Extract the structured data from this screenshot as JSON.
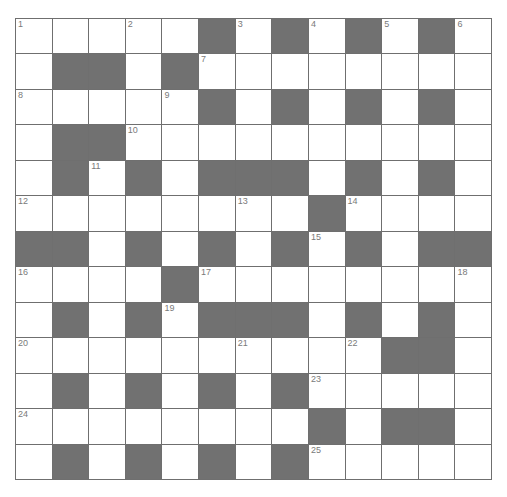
{
  "puzzle": {
    "rows": 13,
    "cols": 13,
    "layout": [
      "WWWWWBWBWBWBW",
      "WBBWBWWWWWWWW",
      "WWWWWBWBWBWBW",
      "WBBWWWWWWWWWW",
      "WBWBWBBBWBWBW",
      "WWWWWWWWBWWWW",
      "BBWBWBWBWBWBB",
      "WWWWBWWWWWWWW",
      "WBWBWBBBWBWBW",
      "WWWWWWWWWWBBW",
      "WBWBWBWBWWWWW",
      "WWWWWWWWBWBBW",
      "WBWBWBWBWWWWW"
    ],
    "numbers": [
      {
        "r": 0,
        "c": 0,
        "n": "1"
      },
      {
        "r": 0,
        "c": 3,
        "n": "2"
      },
      {
        "r": 0,
        "c": 6,
        "n": "3"
      },
      {
        "r": 0,
        "c": 8,
        "n": "4"
      },
      {
        "r": 0,
        "c": 10,
        "n": "5"
      },
      {
        "r": 0,
        "c": 12,
        "n": "6"
      },
      {
        "r": 1,
        "c": 5,
        "n": "7"
      },
      {
        "r": 2,
        "c": 0,
        "n": "8"
      },
      {
        "r": 2,
        "c": 4,
        "n": "9"
      },
      {
        "r": 3,
        "c": 3,
        "n": "10"
      },
      {
        "r": 4,
        "c": 2,
        "n": "11"
      },
      {
        "r": 5,
        "c": 0,
        "n": "12"
      },
      {
        "r": 5,
        "c": 6,
        "n": "13"
      },
      {
        "r": 5,
        "c": 9,
        "n": "14"
      },
      {
        "r": 6,
        "c": 8,
        "n": "15"
      },
      {
        "r": 7,
        "c": 0,
        "n": "16"
      },
      {
        "r": 7,
        "c": 5,
        "n": "17"
      },
      {
        "r": 7,
        "c": 12,
        "n": "18"
      },
      {
        "r": 8,
        "c": 4,
        "n": "19"
      },
      {
        "r": 9,
        "c": 0,
        "n": "20"
      },
      {
        "r": 9,
        "c": 6,
        "n": "21"
      },
      {
        "r": 9,
        "c": 9,
        "n": "22"
      },
      {
        "r": 10,
        "c": 8,
        "n": "23"
      },
      {
        "r": 11,
        "c": 0,
        "n": "24"
      },
      {
        "r": 12,
        "c": 8,
        "n": "25"
      }
    ],
    "colors": {
      "block": "#717171",
      "cell": "#ffffff",
      "line": "#6f6f6f",
      "number": "#7a7a7a"
    }
  }
}
